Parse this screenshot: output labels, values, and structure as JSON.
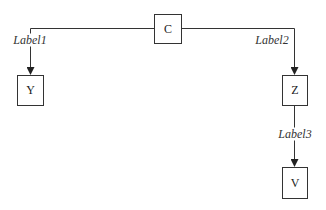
{
  "diagram": {
    "type": "tree",
    "colors": {
      "stroke": "#333333",
      "text": "#222222",
      "background": "#ffffff"
    },
    "nodes": [
      {
        "id": "C",
        "label": "C",
        "x": 154,
        "y": 14,
        "w": 28,
        "h": 30
      },
      {
        "id": "Y",
        "label": "Y",
        "x": 17,
        "y": 75,
        "w": 27,
        "h": 31
      },
      {
        "id": "Z",
        "label": "Z",
        "x": 282,
        "y": 75,
        "w": 26,
        "h": 31
      },
      {
        "id": "V",
        "label": "V",
        "x": 282,
        "y": 167,
        "w": 26,
        "h": 32
      }
    ],
    "edges": [
      {
        "from": "C",
        "to": "Y",
        "label": "Label1",
        "label_x": 30,
        "label_y": 40
      },
      {
        "from": "C",
        "to": "Z",
        "label": "Label2",
        "label_x": 272,
        "label_y": 40
      },
      {
        "from": "Z",
        "to": "V",
        "label": "Label3",
        "label_x": 295,
        "label_y": 134
      }
    ]
  }
}
